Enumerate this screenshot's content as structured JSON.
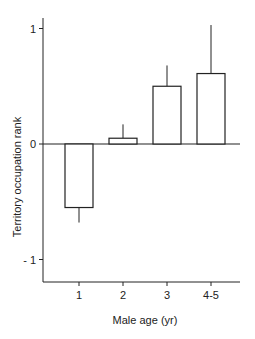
{
  "chart_data": {
    "type": "bar",
    "title": "",
    "xlabel": "Male age (yr)",
    "ylabel": "Territory occupation rank",
    "categories": [
      "1",
      "2",
      "3",
      "4-5"
    ],
    "values": [
      -0.55,
      0.05,
      0.5,
      0.61
    ],
    "error_upper": [
      null,
      0.17,
      0.68,
      1.03
    ],
    "error_lower": [
      -0.68,
      null,
      null,
      null
    ],
    "ylim": [
      -1.2,
      1.1
    ],
    "yticks": [
      {
        "value": 1,
        "label": "1"
      },
      {
        "value": 0,
        "label": "0"
      },
      {
        "value": -1,
        "label": "- 1"
      }
    ],
    "grid": false,
    "legend": null,
    "bar_fill": "#ffffff",
    "bar_stroke": "#222222"
  }
}
